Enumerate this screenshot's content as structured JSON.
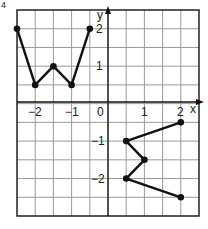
{
  "figure_marker": "4",
  "chart_data": {
    "type": "line",
    "title": "",
    "xlabel": "x",
    "ylabel": "y",
    "xlim": [
      -2.5,
      2.5
    ],
    "ylim": [
      -3,
      2.5
    ],
    "grid": true,
    "grid_step": 0.5,
    "x_tick_labels": [
      "-2",
      "-1",
      "0",
      "1",
      "2"
    ],
    "y_tick_labels": [
      "2",
      "1",
      "-1",
      "-2"
    ],
    "series": [
      {
        "name": "shape-quadrant-2",
        "points": [
          [
            -2.5,
            2
          ],
          [
            -2,
            0.5
          ],
          [
            -1.5,
            1
          ],
          [
            -1,
            0.5
          ],
          [
            -0.5,
            2
          ]
        ]
      },
      {
        "name": "shape-quadrant-4",
        "points": [
          [
            2,
            -0.5
          ],
          [
            0.5,
            -1
          ],
          [
            1,
            -1.5
          ],
          [
            0.5,
            -2
          ],
          [
            2,
            -2.5
          ]
        ]
      }
    ]
  },
  "labels": {
    "x_axis": "x",
    "y_axis": "y",
    "xt_m2": "−2",
    "xt_m1": "−1",
    "xt_0": "0",
    "xt_1": "1",
    "xt_2": "2",
    "yt_2": "2",
    "yt_1": "1",
    "yt_m1": "−1",
    "yt_m2": "−2"
  },
  "colors": {
    "grid": "#9a9a9a",
    "border": "#222222",
    "line": "#111111"
  }
}
